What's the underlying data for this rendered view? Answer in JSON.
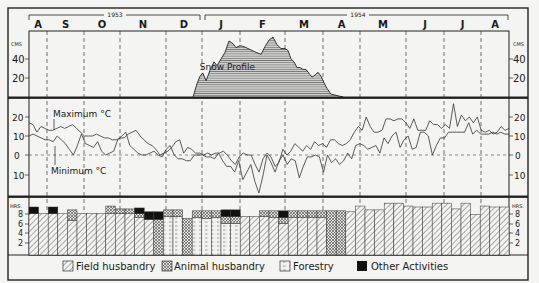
{
  "chart_data": [
    {
      "type": "area",
      "title": "Snow Profile",
      "ylabel": "CMS",
      "yticks": [
        20,
        40
      ],
      "ylim": [
        0,
        70
      ],
      "x_unit": "pixel-position along shared month axis (Aug 1953 – Aug 1954)",
      "points": [
        [
          193,
          0
        ],
        [
          197,
          14
        ],
        [
          200,
          22
        ],
        [
          203,
          25
        ],
        [
          206,
          17
        ],
        [
          210,
          28
        ],
        [
          214,
          37
        ],
        [
          217,
          33
        ],
        [
          221,
          40
        ],
        [
          225,
          47
        ],
        [
          229,
          59
        ],
        [
          233,
          56
        ],
        [
          236,
          52
        ],
        [
          240,
          54
        ],
        [
          244,
          53
        ],
        [
          248,
          51
        ],
        [
          252,
          49
        ],
        [
          256,
          47
        ],
        [
          261,
          45
        ],
        [
          265,
          53
        ],
        [
          269,
          60
        ],
        [
          273,
          63
        ],
        [
          277,
          55
        ],
        [
          281,
          51
        ],
        [
          285,
          51
        ],
        [
          288,
          49
        ],
        [
          291,
          40
        ],
        [
          294,
          37
        ],
        [
          297,
          31
        ],
        [
          300,
          31
        ],
        [
          303,
          29
        ],
        [
          306,
          29
        ],
        [
          309,
          25
        ],
        [
          312,
          21
        ],
        [
          315,
          23
        ],
        [
          318,
          26
        ],
        [
          321,
          22
        ],
        [
          324,
          15
        ],
        [
          327,
          9
        ],
        [
          331,
          3
        ],
        [
          335,
          2
        ],
        [
          339,
          1
        ],
        [
          343,
          0
        ]
      ]
    },
    {
      "type": "line",
      "title": "Temperature",
      "ylabel": "°C",
      "yticks": [
        20,
        10,
        0,
        -10
      ],
      "ylim": [
        -20,
        30
      ],
      "series": [
        {
          "name": "Maximum °C",
          "values": [
            17,
            16,
            12,
            15,
            14,
            13,
            13,
            14,
            15,
            14,
            15,
            16,
            14,
            12,
            10,
            10,
            10,
            11,
            10,
            9,
            9,
            8,
            8,
            9,
            9,
            11,
            12,
            13,
            10,
            8,
            6,
            5,
            3,
            0,
            1,
            2,
            4,
            7,
            8,
            1,
            4,
            3,
            1,
            1,
            0,
            1,
            0,
            1,
            1,
            2,
            0,
            -3,
            -5,
            -1,
            1,
            0,
            0,
            -5,
            -9,
            -2,
            1,
            -1,
            -6,
            -4,
            3,
            0,
            2,
            6,
            4,
            2,
            5,
            3,
            7,
            5,
            6,
            4,
            8,
            8,
            6,
            5,
            6,
            8,
            12,
            15,
            13,
            20,
            15,
            12,
            12,
            13,
            19,
            19,
            18,
            19,
            19,
            17,
            14,
            19,
            13,
            13,
            13,
            18,
            16,
            16,
            14,
            16,
            14,
            27,
            15,
            21,
            18,
            20,
            17,
            20,
            13,
            12,
            13,
            11,
            12,
            15,
            13,
            14
          ]
        },
        {
          "name": "Minimum °C",
          "values": [
            10,
            11,
            10,
            9,
            8,
            8,
            7,
            10,
            8,
            6,
            3,
            0,
            5,
            11,
            6,
            5,
            4,
            7,
            2,
            0,
            1,
            2,
            8,
            10,
            12,
            5,
            3,
            1,
            0,
            0,
            1,
            2,
            0,
            -1,
            3,
            5,
            0,
            -2,
            -2,
            -3,
            -3,
            0,
            0,
            0,
            -1,
            -1,
            -2,
            1,
            -3,
            -6,
            -6,
            -9,
            -3,
            -13,
            -9,
            -5,
            -14,
            -20,
            -11,
            0,
            -4,
            -9,
            -3,
            0,
            -5,
            -2,
            -3,
            -12,
            -6,
            -1,
            -1,
            0,
            -1,
            -9,
            0,
            -4,
            -2,
            -5,
            -3,
            1,
            -2,
            5,
            6,
            5,
            3,
            4,
            5,
            1,
            9,
            6,
            10,
            12,
            4,
            8,
            10,
            3,
            4,
            12,
            12,
            10,
            0,
            5,
            9,
            9,
            12,
            12,
            12,
            12,
            12,
            17,
            11,
            13,
            11,
            11,
            11,
            12,
            11,
            12,
            11,
            11
          ]
        }
      ],
      "annotations": [
        "Maximum °C",
        "Minimum °C"
      ]
    },
    {
      "type": "bar",
      "title": "Working hours per week by activity",
      "ylabel": "HRS.",
      "yticks": [
        2,
        4,
        6,
        8
      ],
      "ylim": [
        0,
        11
      ],
      "stacked": true,
      "legend": [
        {
          "key": "field",
          "label": "Field husbandry",
          "pattern": "diagonal-hatch"
        },
        {
          "key": "animal",
          "label": "Animal husbandry",
          "pattern": "cross-hatch"
        },
        {
          "key": "forestry",
          "label": "Forestry",
          "pattern": "dotted-dashes"
        },
        {
          "key": "other",
          "label": "Other Activities",
          "pattern": "solid-black"
        }
      ],
      "bars": [
        {
          "field": 8.6,
          "animal": 0,
          "forestry": 0,
          "other": 1.4
        },
        {
          "field": 8.6,
          "animal": 0,
          "forestry": 0,
          "other": 0
        },
        {
          "field": 8.6,
          "animal": 0,
          "forestry": 0,
          "other": 1.4
        },
        {
          "field": 8.6,
          "animal": 0,
          "forestry": 0,
          "other": 0
        },
        {
          "field": 7.2,
          "animal": 2.2,
          "forestry": 0,
          "other": 0
        },
        {
          "field": 8.6,
          "animal": 0,
          "forestry": 0,
          "other": 0
        },
        {
          "field": 8.6,
          "animal": 0,
          "forestry": 0,
          "other": 0
        },
        {
          "field": 8.6,
          "animal": 0,
          "forestry": 0,
          "other": 0
        },
        {
          "field": 8.6,
          "animal": 1.6,
          "forestry": 0,
          "other": 0
        },
        {
          "field": 8.6,
          "animal": 1.0,
          "forestry": 0,
          "other": 0
        },
        {
          "field": 8.6,
          "animal": 1.0,
          "forestry": 0,
          "other": 0
        },
        {
          "field": 7.8,
          "animal": 0.8,
          "forestry": 0,
          "other": 1.2
        },
        {
          "field": 7.4,
          "animal": 0,
          "forestry": 0,
          "other": 1.6
        },
        {
          "field": 0,
          "animal": 7.4,
          "forestry": 0,
          "other": 1.6
        },
        {
          "field": 0,
          "animal": 1.4,
          "forestry": 8.0,
          "other": 0
        },
        {
          "field": 0,
          "animal": 1.4,
          "forestry": 8.0,
          "other": 0
        },
        {
          "field": 0,
          "animal": 7.6,
          "forestry": 0,
          "other": 0
        },
        {
          "field": 0,
          "animal": 1.4,
          "forestry": 7.8,
          "other": 0
        },
        {
          "field": 0,
          "animal": 1.6,
          "forestry": 7.6,
          "other": 0
        },
        {
          "field": 0,
          "animal": 1.4,
          "forestry": 7.8,
          "other": 0
        },
        {
          "field": 0,
          "animal": 1.4,
          "forestry": 6.6,
          "other": 1.4
        },
        {
          "field": 0,
          "animal": 1.4,
          "forestry": 6.6,
          "other": 1.4
        },
        {
          "field": 8.0,
          "animal": 0,
          "forestry": 0,
          "other": 0
        },
        {
          "field": 8.0,
          "animal": 0,
          "forestry": 0,
          "other": 0
        },
        {
          "field": 8.0,
          "animal": 1.2,
          "forestry": 0,
          "other": 0
        },
        {
          "field": 7.8,
          "animal": 1.4,
          "forestry": 0,
          "other": 0
        },
        {
          "field": 6.6,
          "animal": 1.2,
          "forestry": 0,
          "other": 1.4
        },
        {
          "field": 7.8,
          "animal": 1.4,
          "forestry": 0,
          "other": 0
        },
        {
          "field": 7.8,
          "animal": 1.4,
          "forestry": 0,
          "other": 0
        },
        {
          "field": 7.8,
          "animal": 1.4,
          "forestry": 0,
          "other": 0
        },
        {
          "field": 7.8,
          "animal": 1.4,
          "forestry": 0,
          "other": 0
        },
        {
          "field": 0,
          "animal": 9.2,
          "forestry": 0,
          "other": 0
        },
        {
          "field": 0,
          "animal": 9.2,
          "forestry": 0,
          "other": 0
        },
        {
          "field": 9.0,
          "animal": 0,
          "forestry": 0,
          "other": 0
        },
        {
          "field": 10.2,
          "animal": 0,
          "forestry": 0,
          "other": 0
        },
        {
          "field": 9.4,
          "animal": 0,
          "forestry": 0,
          "other": 0
        },
        {
          "field": 9.4,
          "animal": 0,
          "forestry": 0,
          "other": 0
        },
        {
          "field": 10.8,
          "animal": 0,
          "forestry": 0,
          "other": 0
        },
        {
          "field": 10.8,
          "animal": 0,
          "forestry": 0,
          "other": 0
        },
        {
          "field": 10.2,
          "animal": 0,
          "forestry": 0,
          "other": 0
        },
        {
          "field": 10.0,
          "animal": 0,
          "forestry": 0,
          "other": 0
        },
        {
          "field": 10.0,
          "animal": 0,
          "forestry": 0,
          "other": 0
        },
        {
          "field": 10.8,
          "animal": 0,
          "forestry": 0,
          "other": 0
        },
        {
          "field": 10.8,
          "animal": 0,
          "forestry": 0,
          "other": 0
        },
        {
          "field": 9.6,
          "animal": 0,
          "forestry": 0,
          "other": 0
        },
        {
          "field": 10.8,
          "animal": 0,
          "forestry": 0,
          "other": 0
        },
        {
          "field": 8.4,
          "animal": 0,
          "forestry": 0,
          "other": 0
        },
        {
          "field": 10.2,
          "animal": 0,
          "forestry": 0,
          "other": 0
        },
        {
          "field": 10.0,
          "animal": 0,
          "forestry": 0,
          "other": 0
        },
        {
          "field": 10.0,
          "animal": 0,
          "forestry": 0,
          "other": 0
        }
      ]
    }
  ],
  "axis": {
    "year_1": "1953",
    "year_2": "1954",
    "months": [
      {
        "label": "A",
        "x0": 29,
        "x1": 47
      },
      {
        "label": "S",
        "x0": 47,
        "x1": 84
      },
      {
        "label": "O",
        "x0": 84,
        "x1": 120
      },
      {
        "label": "N",
        "x0": 120,
        "x1": 166
      },
      {
        "label": "D",
        "x0": 166,
        "x1": 202
      },
      {
        "label": "J",
        "x0": 202,
        "x1": 240
      },
      {
        "label": "F",
        "x0": 240,
        "x1": 285
      },
      {
        "label": "M",
        "x0": 285,
        "x1": 323
      },
      {
        "label": "A",
        "x0": 323,
        "x1": 360
      },
      {
        "label": "M",
        "x0": 360,
        "x1": 406
      },
      {
        "label": "J",
        "x0": 406,
        "x1": 444
      },
      {
        "label": "J",
        "x0": 444,
        "x1": 481
      },
      {
        "label": "A",
        "x0": 481,
        "x1": 509
      }
    ]
  },
  "labels": {
    "snow_unit": "CMS",
    "snow_title": "Snow Profile",
    "snow_ticks": [
      "40",
      "20"
    ],
    "temp_max": "Maximum °C",
    "temp_min": "Minimum °C",
    "temp_ticks": [
      "20",
      "10",
      "0",
      "10"
    ],
    "hrs_unit": "HRS.",
    "hrs_ticks": [
      "8",
      "6",
      "4",
      "2"
    ]
  },
  "legend": [
    {
      "label": "Field husbandry"
    },
    {
      "label": "Animal husbandry"
    },
    {
      "label": "Forestry"
    },
    {
      "label": "Other Activities"
    }
  ]
}
